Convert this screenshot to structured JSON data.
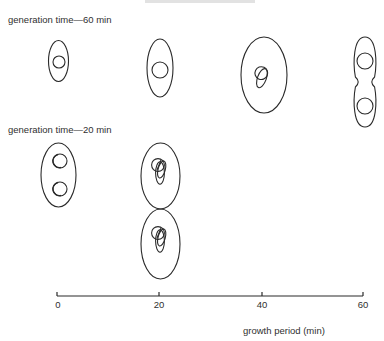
{
  "rows": [
    {
      "label": "generation time—60 min",
      "cells": [
        {
          "time": 0,
          "cx": 58.5,
          "cy": 61,
          "rx": 10,
          "ry": 20.5,
          "shape": "ellipse",
          "nucleoids": [
            {
              "cx": 59,
              "cy": 62,
              "r": 6,
              "type": "circle"
            }
          ]
        },
        {
          "time": 20,
          "cx": 160,
          "cy": 68,
          "rx": 13,
          "ry": 29,
          "shape": "ellipse",
          "nucleoids": [
            {
              "cx": 160,
              "cy": 70,
              "r": 8,
              "type": "circle"
            }
          ]
        },
        {
          "time": 40,
          "cx": 264,
          "cy": 75,
          "rx": 23,
          "ry": 38,
          "shape": "ellipse",
          "nucleoids": [
            {
              "cx": 262,
              "cy": 75,
              "r": 8,
              "type": "replicating"
            }
          ]
        },
        {
          "time": 60,
          "cx": 365,
          "cy": 82,
          "rx": 12,
          "ry": 45,
          "shape": "dividing",
          "nucleoids": [
            {
              "cx": 365,
              "cy": 61,
              "r": 8,
              "type": "circle"
            },
            {
              "cx": 365,
              "cy": 106,
              "r": 8,
              "type": "circle"
            }
          ]
        }
      ]
    },
    {
      "label": "generation time—20 min",
      "cells": [
        {
          "time": 0,
          "cx": 58.5,
          "cy": 175,
          "rx": 17.5,
          "ry": 32,
          "shape": "ellipse",
          "nucleoids": [
            {
              "cx": 60,
              "cy": 161,
              "r": 7,
              "type": "crescent"
            },
            {
              "cx": 60,
              "cy": 189,
              "r": 7,
              "type": "crescent"
            }
          ]
        },
        {
          "time": 20,
          "cx": 160.5,
          "cy": 176,
          "rx": 19.5,
          "ry": 33,
          "shape": "ellipse",
          "nucleoids": [
            {
              "cx": 160,
              "cy": 168,
              "r": 8,
              "type": "multifork"
            }
          ]
        },
        {
          "time": 20,
          "cx": 160.5,
          "cy": 244,
          "rx": 19.5,
          "ry": 35,
          "shape": "ellipse",
          "nucleoids": [
            {
              "cx": 160,
              "cy": 236,
              "r": 8,
              "type": "multifork"
            }
          ]
        }
      ]
    }
  ],
  "axis": {
    "label": "growth period (min)",
    "ticks": [
      {
        "value": "0",
        "x": 57
      },
      {
        "value": "20",
        "x": 159
      },
      {
        "value": "40",
        "x": 262
      },
      {
        "value": "60",
        "x": 363
      }
    ],
    "y": 296,
    "x_start": 57,
    "x_end": 363
  },
  "colors": {
    "stroke": "#2a2a2a",
    "background": "#ffffff"
  }
}
